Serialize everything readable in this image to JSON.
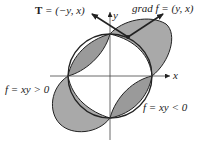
{
  "diagram": {
    "labels": {
      "tangent_label": "T = (−y, x)",
      "tangent_symbol": "T",
      "tangent_expr": " =  (−y, x)",
      "gradient_label": "grad f = (y, x)",
      "x_axis": "x",
      "y_axis": "y",
      "positive_region": "f = xy > 0",
      "negative_region": "f = xy < 0"
    },
    "colors": {
      "shade": "#a9a9a9",
      "shade_dark": "#8f8f8f",
      "stroke": "#222222",
      "background": "#ffffff"
    },
    "geometry": {
      "circle_center": [
        110,
        76
      ],
      "circle_radius": 42,
      "point": [
        128,
        37
      ]
    }
  }
}
